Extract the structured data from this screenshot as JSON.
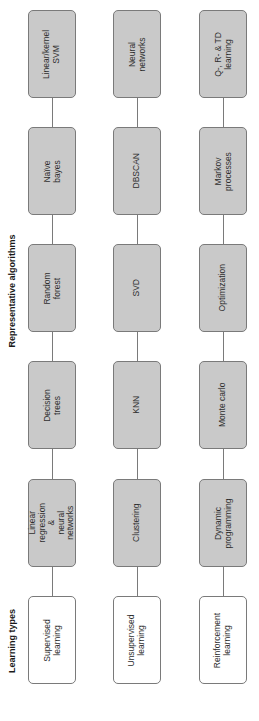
{
  "headings": {
    "learning_types": "Learning types",
    "representative_algorithms": "Representative algorithms"
  },
  "rows": [
    {
      "type": "Supervised\nlearning",
      "algorithms": [
        "Linear\nregression &\nneural networks",
        "Decision trees",
        "Random forest",
        "Naïve bayes",
        "Linear/kernel\nSVM"
      ]
    },
    {
      "type": "Unsupervised\nlearning",
      "algorithms": [
        "Clustering",
        "KNN",
        "SVD",
        "DBSCAN",
        "Neural networks"
      ]
    },
    {
      "type": "Reinforcement\nlearning",
      "algorithms": [
        "Dynamic\nprogramming",
        "Monte carlo",
        "Optimization",
        "Markov\nprocesses",
        "Q-, R- & TD\nlearning"
      ]
    }
  ],
  "colors": {
    "algorithm_fill": "#c9c9c9",
    "type_fill": "#ffffff",
    "border": "#7a7a7a"
  }
}
